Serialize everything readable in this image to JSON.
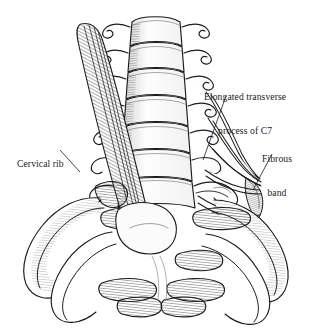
{
  "figure": {
    "background_color": "#ffffff",
    "ink_color": "#1b1b1b",
    "width": 322,
    "height": 334,
    "style": "pen-and-ink anatomical line drawing with hatching"
  },
  "labels": {
    "c7": {
      "line1": "Elongated transverse",
      "line2": "process of C7",
      "full": "Elongated transverse process of C7"
    },
    "cervical_rib": {
      "line1": "Cervical rib",
      "full": "Cervical rib"
    },
    "fibrous_band": {
      "line1": "Fibrous",
      "line2": "band",
      "full": "Fibrous band"
    }
  },
  "structures": [
    "cervical vertebral bodies",
    "cervical transverse processes",
    "elongated transverse process of C7",
    "cervical rib",
    "fibrous band",
    "brachial plexus nerve roots",
    "first rib",
    "second rib"
  ]
}
